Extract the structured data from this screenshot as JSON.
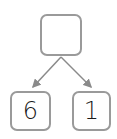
{
  "diagram": {
    "type": "number-bond",
    "top": {
      "value": ""
    },
    "children": [
      {
        "value": "6"
      },
      {
        "value": "1"
      }
    ],
    "colors": {
      "border": "#9a9a9a",
      "arrow": "#8a8a8a",
      "text": "#1a1a1a"
    }
  }
}
